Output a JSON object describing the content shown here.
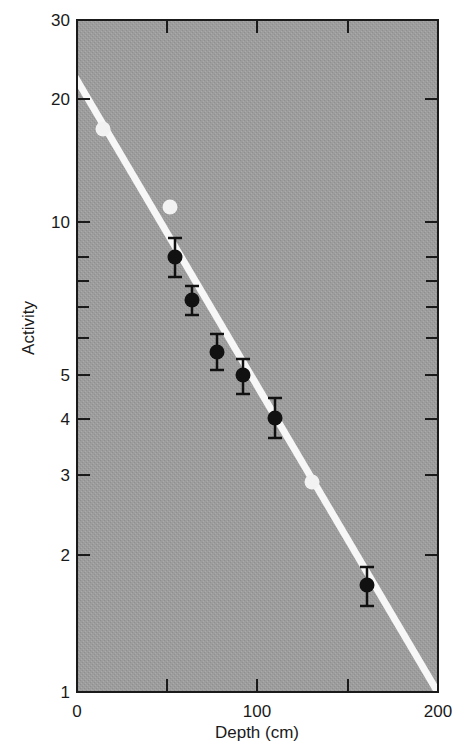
{
  "chart_data": {
    "type": "scatter",
    "title": "",
    "xlabel": "Depth (cm)",
    "ylabel": "Activity",
    "xlim": [
      0,
      200
    ],
    "ylim": [
      1,
      30
    ],
    "yscale": "log",
    "grid": false,
    "legend": null,
    "x_ticks": [
      {
        "value": 0,
        "label": "0",
        "px": 77
      },
      {
        "value": 50,
        "label": "",
        "px": 167
      },
      {
        "value": 100,
        "label": "100",
        "px": 257
      },
      {
        "value": 150,
        "label": "",
        "px": 348
      },
      {
        "value": 200,
        "label": "200",
        "px": 438
      }
    ],
    "y_ticks": [
      {
        "value": 30,
        "label": "30",
        "px": 20
      },
      {
        "value": 20,
        "label": "20",
        "px": 99
      },
      {
        "value": 10,
        "label": "10",
        "px": 222
      },
      {
        "value": 9,
        "label": "",
        "px": 257
      },
      {
        "value": 8,
        "label": "",
        "px": 281
      },
      {
        "value": 7,
        "label": "",
        "px": 307
      },
      {
        "value": 6,
        "label": "",
        "px": 338
      },
      {
        "value": 5,
        "label": "5",
        "px": 375
      },
      {
        "value": 4,
        "label": "4",
        "px": 419
      },
      {
        "value": 3,
        "label": "3",
        "px": 475
      },
      {
        "value": 2,
        "label": "2",
        "px": 555
      },
      {
        "value": 1,
        "label": "1",
        "px": 692
      }
    ],
    "series": [
      {
        "name": "measured (with error bars)",
        "marker": "filled-circle",
        "color": "#111111",
        "points": [
          {
            "x": 54,
            "y": 9.0,
            "y_low": 8.1,
            "y_high": 9.8,
            "px": 175,
            "py": 257,
            "bar_top": 238,
            "bar_bottom": 277
          },
          {
            "x": 64,
            "y": 7.3,
            "y_low": 6.7,
            "y_high": 7.9,
            "px": 192,
            "py": 300,
            "bar_top": 286,
            "bar_bottom": 315
          },
          {
            "x": 78,
            "y": 5.6,
            "y_low": 5.1,
            "y_high": 6.1,
            "px": 217,
            "py": 352,
            "bar_top": 334,
            "bar_bottom": 370
          },
          {
            "x": 92,
            "y": 5.0,
            "y_low": 4.6,
            "y_high": 5.4,
            "px": 243,
            "py": 375,
            "bar_top": 359,
            "bar_bottom": 394
          },
          {
            "x": 110,
            "y": 4.0,
            "y_low": 3.6,
            "y_high": 4.4,
            "px": 275,
            "py": 418,
            "bar_top": 398,
            "bar_bottom": 438
          },
          {
            "x": 161,
            "y": 1.7,
            "y_low": 1.55,
            "y_high": 1.87,
            "px": 367,
            "py": 585,
            "bar_top": 567,
            "bar_bottom": 606
          }
        ]
      },
      {
        "name": "other points",
        "marker": "open-white-circle",
        "color": "#f2f2f2",
        "points": [
          {
            "x": 14,
            "y": 17,
            "px": 103,
            "py": 129
          },
          {
            "x": 52,
            "y": 10.9,
            "px": 170,
            "py": 207
          },
          {
            "x": 130,
            "y": 2.9,
            "px": 312,
            "py": 482
          }
        ]
      }
    ],
    "fit_line": {
      "name": "exponential fit",
      "color": "#f7f7f7",
      "from": {
        "x": 0,
        "y": 22,
        "px": 77,
        "py": 80
      },
      "to": {
        "x": 200,
        "y": 1,
        "px": 437,
        "py": 691
      }
    },
    "style": {
      "plot_background": "#9d9d9d",
      "frame_color": "#1a1a1a"
    }
  }
}
